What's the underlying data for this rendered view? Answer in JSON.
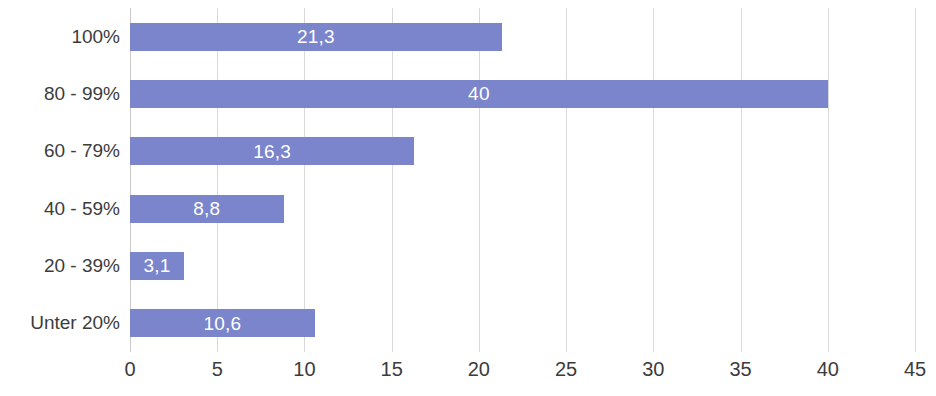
{
  "chart_data": {
    "type": "bar",
    "orientation": "horizontal",
    "title": "",
    "xlabel": "",
    "ylabel": "",
    "categories": [
      "100%",
      "80 - 99%",
      "60 - 79%",
      "40 - 59%",
      "20 - 39%",
      "Unter 20%"
    ],
    "values": [
      21.3,
      40,
      16.3,
      8.8,
      3.1,
      10.6
    ],
    "value_labels": [
      "21,3",
      "40",
      "16,3",
      "8,8",
      "3,1",
      "10,6"
    ],
    "xlim": [
      0,
      45
    ],
    "xticks": [
      0,
      5,
      10,
      15,
      20,
      25,
      30,
      35,
      40,
      45
    ],
    "xtick_labels": [
      "0",
      "5",
      "10",
      "15",
      "20",
      "25",
      "30",
      "35",
      "40",
      "45"
    ],
    "grid": true,
    "grid_axis": "x",
    "legend": false,
    "bar_color": "#7b85cc",
    "label_color": "#ffffff",
    "grid_color": "#d9d9d9",
    "axis_color": "#c9c9c9",
    "tick_label_color": "#3c3c3c"
  }
}
